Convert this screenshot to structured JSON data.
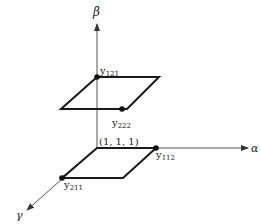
{
  "diagram": {
    "type": "3d-lattice-sketch",
    "axes": {
      "alpha": {
        "label": "α"
      },
      "beta": {
        "label": "β"
      },
      "gamma": {
        "label": "γ"
      }
    },
    "origin_label": "(1, 1, 1)",
    "points": [
      {
        "base": "y",
        "sub": "121"
      },
      {
        "base": "y",
        "sub": "222"
      },
      {
        "base": "y",
        "sub": "112"
      },
      {
        "base": "y",
        "sub": "211"
      }
    ],
    "colors": {
      "line": "#1a1a1a",
      "axis": "#555555",
      "background": "#ffffff"
    }
  }
}
